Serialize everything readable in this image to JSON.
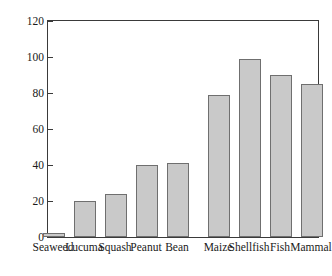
{
  "chart_data": {
    "type": "bar",
    "title": "",
    "subtitle": "",
    "xlabel": "",
    "ylabel": "Percent of soil samples containing food items",
    "categories": [
      "Seaweed",
      "Lucuma",
      "Squash",
      "Peanut",
      "Bean",
      "Maize",
      "Shellfish",
      "Fish",
      "Mammal"
    ],
    "values": [
      2,
      20,
      24,
      40,
      41,
      79,
      99,
      90,
      85
    ],
    "ylim": [
      0,
      120
    ],
    "yticks": [
      0,
      20,
      40,
      60,
      80,
      100,
      120
    ],
    "ytick_labels": [
      "0",
      "20",
      "40",
      "60",
      "80",
      "100",
      "120"
    ],
    "grid": false,
    "legend": null,
    "legend_position": "none",
    "bar_fill_color": "#c9c9c9",
    "bar_edge_color": "#6f6f6f",
    "axis_color": "#3a3a3a",
    "background_color": "#ffffff",
    "annotations": []
  }
}
